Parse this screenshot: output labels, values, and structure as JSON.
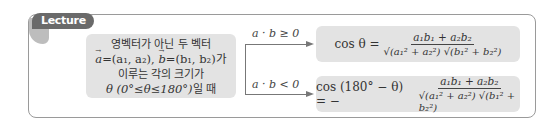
{
  "badge": {
    "label": "Lecture"
  },
  "condition": {
    "line1": "영벡터가 아닌 두 벡터",
    "line2_a": "a",
    "line2_mid": "=(a₁, a₂), ",
    "line2_b": "b",
    "line2_end": "=(b₁, b₂)가",
    "line3": "이루는 각의 크기가",
    "line4_math": "θ (0°≤θ≤180°)",
    "line4_ko": "일 때"
  },
  "branches": [
    {
      "condition_label": "a · b ≥ 0",
      "lhs": "cos θ =",
      "numerator": "a₁b₁ + a₂b₂",
      "denominator": "√(a₁² + a₂²) √(b₁² + b₂²)"
    },
    {
      "condition_label": "a · b < 0",
      "lhs": "cos (180° − θ) = −",
      "numerator": "a₁b₁ + a₂b₂",
      "denominator": "√(a₁² + a₂²) √(b₁² + b₂²)"
    }
  ],
  "colors": {
    "badge": "#6a6a6a",
    "box_fill": "#e3e3e3",
    "frame": "#9a9a9a",
    "arrow": "#777777"
  }
}
